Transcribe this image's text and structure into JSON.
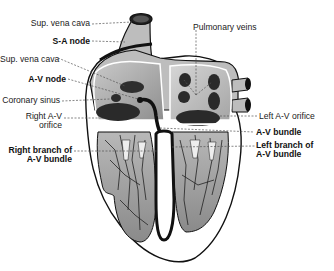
{
  "diagram": {
    "labels_left": [
      {
        "id": "sup_vena_cava_top",
        "text": "Sup. vena cava",
        "bold": false
      },
      {
        "id": "sa_node",
        "text": "S-A node",
        "bold": true
      },
      {
        "id": "sup_vena_cava_inner",
        "text": "Sup. vena cava",
        "bold": false
      },
      {
        "id": "av_node",
        "text": "A-V node",
        "bold": true
      },
      {
        "id": "coronary_sinus",
        "text": "Coronary sinus",
        "bold": false
      },
      {
        "id": "right_av_orifice_1",
        "text": "Right A-V",
        "bold": false
      },
      {
        "id": "right_av_orifice_2",
        "text": "orifice",
        "bold": false
      },
      {
        "id": "right_branch_1",
        "text": "Right branch of",
        "bold": true
      },
      {
        "id": "right_branch_2",
        "text": "A-V bundle",
        "bold": true
      }
    ],
    "labels_right": [
      {
        "id": "pulmonary_veins",
        "text": "Pulmonary veins",
        "bold": false
      },
      {
        "id": "left_av_orifice",
        "text": "Left A-V orifice",
        "bold": false
      },
      {
        "id": "av_bundle",
        "text": "A-V bundle",
        "bold": true
      },
      {
        "id": "left_branch_1",
        "text": "Left branch of",
        "bold": true
      },
      {
        "id": "left_branch_2",
        "text": "A-V bundle",
        "bold": true
      }
    ],
    "colors": {
      "outline": "#111111",
      "wall": "#bdbdbd",
      "chamber": "#9a9a9a",
      "chamber_light": "#cfcfcf",
      "dark": "#2a2a2a",
      "leader": "#555555"
    }
  }
}
